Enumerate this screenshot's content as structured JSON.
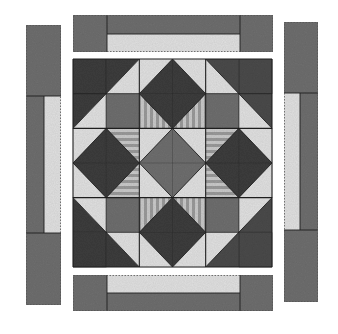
{
  "diagram": {
    "title": "Quilt block with border strips",
    "colors": {
      "background": "#ffffff",
      "dark": "#3c3c3c",
      "dark_speckle": "#4a4a4a",
      "medium": "#6e6e6e",
      "light": "#e0e0e0",
      "stripe_a": "#9a9a9a",
      "stripe_b": "#c9c9c9",
      "seam": "#1e1e1e"
    },
    "borders": {
      "top": {
        "x": 73,
        "y": 15,
        "w": 200,
        "h": 37,
        "end_left_w": 34,
        "end_right_x": 240,
        "light_strip": {
          "x": 107,
          "y": 34,
          "w": 133,
          "h": 18
        }
      },
      "bottom": {
        "x": 73,
        "y": 275,
        "w": 200,
        "h": 36,
        "end_left_w": 34,
        "end_right_x": 240,
        "light_strip": {
          "x": 107,
          "y": 275,
          "w": 133,
          "h": 18
        }
      },
      "left": {
        "x": 26,
        "y": 25,
        "w": 35,
        "h": 280,
        "end_top_h": 71,
        "end_bottom_y": 233,
        "light_strip": {
          "x": 44,
          "y": 96,
          "w": 17,
          "h": 137
        }
      },
      "right": {
        "x": 284,
        "y": 22,
        "w": 34,
        "h": 280,
        "end_top_h": 71,
        "end_bottom_y": 230,
        "light_strip": {
          "x": 284,
          "y": 93,
          "w": 16,
          "h": 137
        }
      }
    },
    "block": {
      "x": 73,
      "y": 59,
      "w": 199,
      "h": 208,
      "grid": 6,
      "units": [
        {
          "name": "nw-corner",
          "col": 0,
          "row": 0
        },
        {
          "name": "top-diamond",
          "col": 1,
          "row": 0,
          "diamond": "dark",
          "stripes": "vertical",
          "stripe_side": "bottom"
        },
        {
          "name": "ne-corner",
          "col": 2,
          "row": 0
        },
        {
          "name": "left-diamond",
          "col": 0,
          "row": 1,
          "diamond": "dark",
          "stripes": "horizontal",
          "stripe_side": "right"
        },
        {
          "name": "center-diamond",
          "col": 1,
          "row": 1,
          "diamond": "medium",
          "stripes": "none"
        },
        {
          "name": "right-diamond",
          "col": 2,
          "row": 1,
          "diamond": "dark",
          "stripes": "horizontal",
          "stripe_side": "left"
        },
        {
          "name": "sw-corner",
          "col": 0,
          "row": 2
        },
        {
          "name": "bottom-diamond",
          "col": 1,
          "row": 2,
          "diamond": "dark",
          "stripes": "vertical",
          "stripe_side": "top"
        },
        {
          "name": "se-corner",
          "col": 2,
          "row": 2
        }
      ]
    }
  }
}
